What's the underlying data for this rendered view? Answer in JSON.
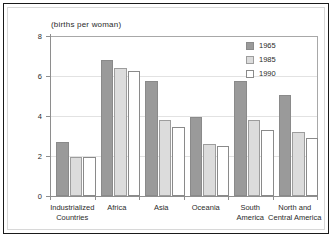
{
  "chart_data": {
    "type": "bar",
    "title": "",
    "subtitle": "(births per woman)",
    "xlabel": "",
    "ylabel": "",
    "ylim": [
      0,
      8
    ],
    "yticks": [
      0,
      2,
      4,
      6,
      8
    ],
    "ytick_labels": [
      "0",
      "2",
      "4",
      "6",
      "8"
    ],
    "grid": true,
    "legend_position": "top-right",
    "categories": [
      "Industrialized\nCountries",
      "Africa",
      "Asia",
      "Oceania",
      "South\nAmerica",
      "North and\nCentral America"
    ],
    "series": [
      {
        "name": "1965",
        "color": "#9a9a9a",
        "values": [
          2.7,
          6.8,
          5.75,
          3.95,
          5.75,
          5.05
        ]
      },
      {
        "name": "1985",
        "color": "#dcdcdc",
        "values": [
          1.95,
          6.4,
          3.8,
          2.6,
          3.8,
          3.2
        ]
      },
      {
        "name": "1990",
        "color": "#ffffff",
        "values": [
          1.95,
          6.25,
          3.45,
          2.5,
          3.3,
          2.9
        ]
      }
    ]
  },
  "legend": {
    "entries": [
      {
        "label": "1965"
      },
      {
        "label": "1985"
      },
      {
        "label": "1990"
      }
    ]
  },
  "colors": {
    "frame": "#1a1a1a",
    "axis": "#8e8e8e",
    "grid": "#e2e2e2",
    "text": "#2b2b2b",
    "series_1965": "#9a9a9a",
    "series_1985": "#dcdcdc",
    "series_1990": "#ffffff"
  }
}
